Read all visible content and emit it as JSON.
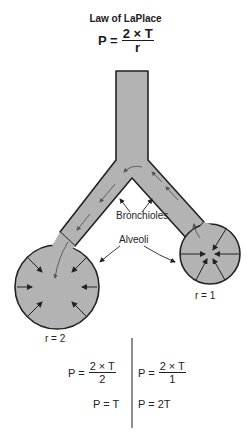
{
  "title": "Law of LaPlace",
  "main_formula": {
    "lhs": "P =",
    "numerator": "2 × T",
    "denominator": "r"
  },
  "labels": {
    "bronchioles": "Bronchioles",
    "alveoli": "Alveoli"
  },
  "left_alveolus": {
    "radius_label": "r = 2",
    "eq1_lhs": "P =",
    "eq1_num": "2 × T",
    "eq1_den": "2",
    "eq2": "P = T"
  },
  "right_alveolus": {
    "radius_label": "r = 1",
    "eq1_lhs": "P =",
    "eq1_num": "2 × T",
    "eq1_den": "1",
    "eq2": "P = 2T"
  },
  "colors": {
    "fill": "#b3b3b3",
    "stroke": "#222222"
  }
}
